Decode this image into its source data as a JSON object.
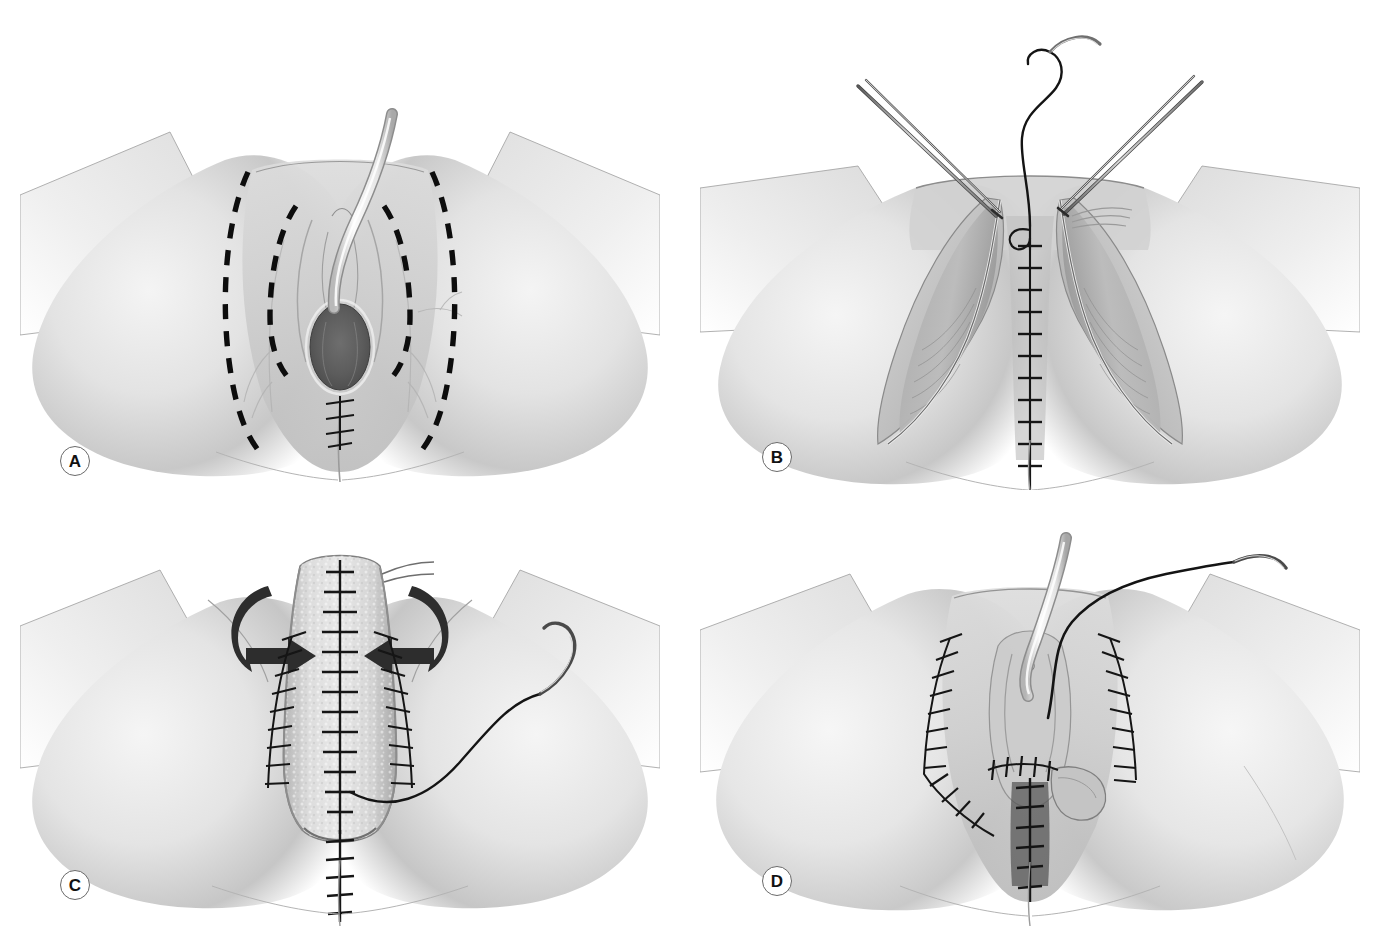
{
  "figure": {
    "type": "surgical-illustration",
    "background_color": "#ffffff",
    "style": "grayscale pencil / airbrush medical illustration",
    "panel_count": 4,
    "layout": "2x2 grid",
    "caption_text": "",
    "palette": {
      "background": "#ffffff",
      "skin_light": "#ededed",
      "skin_mid": "#d4d4d4",
      "skin_shadow": "#b0b0b0",
      "skin_deep_shadow": "#8e8e8e",
      "tissue_dark": "#6f6f6f",
      "cavity_dark": "#575757",
      "ink_black": "#111111",
      "outline_gray": "#6a6a6a",
      "label_border": "#6a6a6a",
      "catheter_light": "#f2f2f2",
      "graft_speckle": "#cfcfcf"
    }
  },
  "panels": [
    {
      "id": "panel-a",
      "label": "A",
      "label_x": 60,
      "label_y": 446,
      "x": 20,
      "y": 100,
      "w": 640,
      "h": 400,
      "description": "Perineum and vulva viewed from below with dashed planned incision lines marked bilaterally; urinary catheter in place; small suture line at the posterior fourchette.",
      "features": [
        "dashed-incision-line-outer-left",
        "dashed-incision-line-inner-left",
        "dashed-incision-line-inner-right",
        "dashed-incision-line-outer-right",
        "urinary-catheter",
        "vaginal-introitus",
        "perineal-suture-line",
        "buttock-left",
        "buttock-right",
        "thigh-left",
        "thigh-right"
      ]
    },
    {
      "id": "panel-b",
      "label": "B",
      "label_x": 762,
      "label_y": 442,
      "x": 700,
      "y": 20,
      "w": 660,
      "h": 470,
      "description": "Flaps elevated and retracted laterally exposing underlying muscle; two fine tissue forceps hold the wound edges while a curved needle with suture closes the midline in a running ladder stitch.",
      "features": [
        "forceps-left",
        "forceps-right",
        "curved-suture-needle",
        "suture-thread",
        "midline-running-suture",
        "elevated-flap-left",
        "elevated-flap-right",
        "exposed-muscle-left",
        "exposed-muscle-right",
        "gluteal-cleft-suture"
      ]
    },
    {
      "id": "panel-c",
      "label": "C",
      "label_x": 60,
      "label_y": 870,
      "x": 20,
      "y": 530,
      "w": 640,
      "h": 400,
      "description": "Tubularized skin-graft neovagina shown in the midline with curved arrows indicating medial rotation/inversion of the flaps; bilateral interrupted suture lines close the donor sites; a curved needle on a long thread lies on the right thigh.",
      "features": [
        "tubularized-graft",
        "graft-midline-suture",
        "rotation-arrow-left",
        "rotation-arrow-right",
        "lateral-suture-line-left",
        "lateral-suture-line-right",
        "curved-suture-needle",
        "suture-thread",
        "perineal-suture-line"
      ]
    },
    {
      "id": "panel-d",
      "label": "D",
      "label_x": 762,
      "label_y": 866,
      "x": 700,
      "y": 530,
      "w": 660,
      "h": 400,
      "description": "Completed reconstruction with bilateral closed suture lines, reconstructed introitus, indwelling catheter and a final suture on a curved needle.",
      "features": [
        "closed-suture-line-left",
        "closed-suture-line-right",
        "reconstructed-introitus",
        "urinary-catheter",
        "curved-suture-needle",
        "suture-thread",
        "perineal-suture-line",
        "transverse-suture-line"
      ]
    }
  ],
  "labels": {
    "a": "A",
    "b": "B",
    "c": "C",
    "d": "D"
  }
}
